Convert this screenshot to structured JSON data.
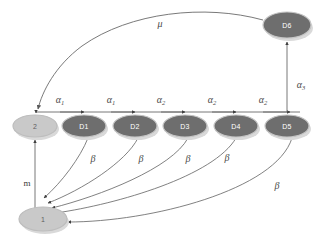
{
  "figure": {
    "type": "state-transition-diagram",
    "background": "#ffffff",
    "colors": {
      "dark_node_fill": "#6e6e6e",
      "light_node_fill": "#c9c9c9",
      "node_stroke": "#b8b8b8",
      "node_shadow": "#d7d7d7",
      "edge_stroke": "#6a6a6a",
      "label_color": "#4a4a4a",
      "dark_node_text": "#ffffff",
      "light_node_text": "#5f5f5f"
    }
  },
  "nodes": [
    {
      "id": "n1",
      "label": "1",
      "x": 43,
      "y": 219,
      "rx": 24,
      "ry": 12,
      "style": "light"
    },
    {
      "id": "n2",
      "label": "2",
      "x": 35,
      "y": 126,
      "rx": 22,
      "ry": 11,
      "style": "light"
    },
    {
      "id": "d1",
      "label": "D1",
      "x": 84,
      "y": 126,
      "rx": 22,
      "ry": 11,
      "style": "dark"
    },
    {
      "id": "d2",
      "label": "D2",
      "x": 135,
      "y": 126,
      "rx": 22,
      "ry": 11,
      "style": "dark"
    },
    {
      "id": "d3",
      "label": "D3",
      "x": 185,
      "y": 126,
      "rx": 22,
      "ry": 11,
      "style": "dark"
    },
    {
      "id": "d4",
      "label": "D4",
      "x": 236,
      "y": 126,
      "rx": 22,
      "ry": 11,
      "style": "dark"
    },
    {
      "id": "d5",
      "label": "D5",
      "x": 287,
      "y": 126,
      "rx": 22,
      "ry": 11,
      "style": "dark"
    },
    {
      "id": "d6",
      "label": "D6",
      "x": 287,
      "y": 25,
      "rx": 24,
      "ry": 13,
      "style": "dark"
    }
  ],
  "edges": [
    {
      "id": "e-2-d1",
      "from": "n2",
      "to": "d1",
      "label": "α",
      "sub": "1",
      "label_x": 60,
      "label_y": 99
    },
    {
      "id": "e-d1-d2",
      "from": "d1",
      "to": "d2",
      "label": "α",
      "sub": "1",
      "label_x": 111,
      "label_y": 99
    },
    {
      "id": "e-d2-d3",
      "from": "d2",
      "to": "d3",
      "label": "α",
      "sub": "2",
      "label_x": 161,
      "label_y": 99
    },
    {
      "id": "e-d3-d4",
      "from": "d3",
      "to": "d4",
      "label": "α",
      "sub": "2",
      "label_x": 212,
      "label_y": 99
    },
    {
      "id": "e-d4-d5",
      "from": "d4",
      "to": "d5",
      "label": "α",
      "sub": "2",
      "label_x": 263,
      "label_y": 99
    },
    {
      "id": "e-d5-d6",
      "from": "d5",
      "to": "d6",
      "label": "α",
      "sub": "3",
      "label_x": 301,
      "label_y": 84
    },
    {
      "id": "e-d6-2",
      "from": "d6",
      "to": "n2",
      "label": "μ",
      "sub": "",
      "label_x": 160,
      "label_y": 23
    },
    {
      "id": "e-1-2",
      "from": "n1",
      "to": "n2",
      "label": "m",
      "sub": "",
      "label_x": 27,
      "label_y": 183
    },
    {
      "id": "e-d1-1",
      "from": "d1",
      "to": "n1",
      "label": "β",
      "sub": "",
      "label_x": 93,
      "label_y": 158
    },
    {
      "id": "e-d2-1",
      "from": "d2",
      "to": "n1",
      "label": "β",
      "sub": "",
      "label_x": 141,
      "label_y": 158
    },
    {
      "id": "e-d3-1",
      "from": "d3",
      "to": "n1",
      "label": "β",
      "sub": "",
      "label_x": 188,
      "label_y": 158
    },
    {
      "id": "e-d4-1",
      "from": "d4",
      "to": "n1",
      "label": "β",
      "sub": "",
      "label_x": 227,
      "label_y": 157
    },
    {
      "id": "e-d5-1",
      "from": "d5",
      "to": "n1",
      "label": "β",
      "sub": "",
      "label_x": 277,
      "label_y": 185
    }
  ]
}
